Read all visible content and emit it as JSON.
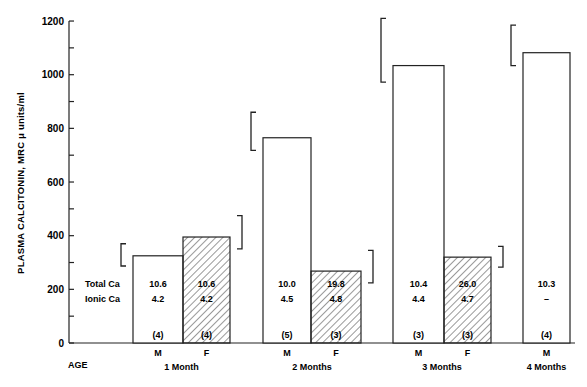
{
  "chart_data": {
    "type": "bar",
    "title": "",
    "xlabel": "AGE",
    "ylabel": "PLASMA CALCITONIN, MRC μ units/ml",
    "ylim": [
      0,
      1200
    ],
    "yticks": [
      0,
      200,
      400,
      600,
      800,
      1000,
      1200
    ],
    "ytick_labels": [
      "0",
      "200",
      "400",
      "600",
      "800",
      "1000",
      "1200"
    ],
    "minor_ticks_every": 100,
    "grid": false,
    "legend": "none (hatched = F, open = M)",
    "groups": [
      {
        "age": "1 Month",
        "bars": [
          {
            "sex": "M",
            "value": 325,
            "error_high": 370,
            "error_side": "left",
            "hatched": false,
            "total_ca": "10.6",
            "ionic_ca": "4.2",
            "n": "(4)"
          },
          {
            "sex": "F",
            "value": 395,
            "error_high": 475,
            "error_side": "right",
            "hatched": true,
            "total_ca": "10.6",
            "ionic_ca": "4.2",
            "n": "(4)"
          }
        ]
      },
      {
        "age": "2 Months",
        "bars": [
          {
            "sex": "M",
            "value": 765,
            "error_high": 860,
            "error_side": "left",
            "hatched": false,
            "total_ca": "10.0",
            "ionic_ca": "4.5",
            "n": "(5)"
          },
          {
            "sex": "F",
            "value": 268,
            "error_high": 345,
            "error_side": "right",
            "hatched": true,
            "total_ca": "19.8",
            "ionic_ca": "4.8",
            "n": "(3)"
          }
        ]
      },
      {
        "age": "3 Months",
        "bars": [
          {
            "sex": "M",
            "value": 1034,
            "error_high": 1210,
            "error_side": "left",
            "hatched": false,
            "total_ca": "10.4",
            "ionic_ca": "4.4",
            "n": "(3)"
          },
          {
            "sex": "F",
            "value": 320,
            "error_high": 360,
            "error_side": "right",
            "hatched": true,
            "total_ca": "26.0",
            "ionic_ca": "4.7",
            "n": "(3)"
          }
        ]
      },
      {
        "age": "4 Months",
        "bars": [
          {
            "sex": "M",
            "value": 1082,
            "error_high": 1185,
            "error_side": "left",
            "hatched": false,
            "total_ca": "10.3",
            "ionic_ca": "–",
            "n": "(4)"
          }
        ]
      }
    ],
    "row_labels": {
      "total_ca": "Total Ca",
      "ionic_ca": "Ionic Ca"
    }
  }
}
